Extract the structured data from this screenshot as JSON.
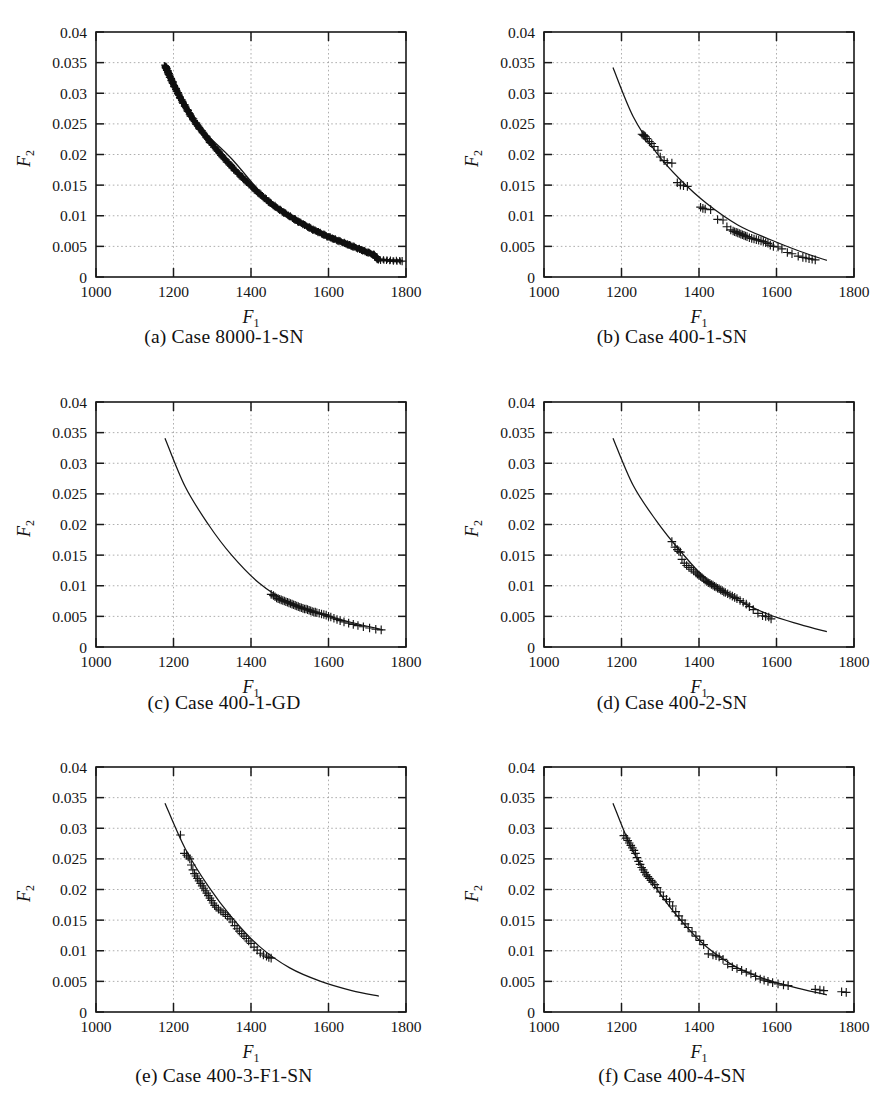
{
  "figure": {
    "panel_count": 6,
    "layout": "2 columns x 3 rows",
    "marker_symbol": "+",
    "curve_label": "fitted Pareto front curve"
  },
  "axes_common": {
    "xlabel": "F",
    "xlabel_sub": "1",
    "ylabel": "F",
    "ylabel_sub": "2",
    "xticks": [
      "1000",
      "1200",
      "1400",
      "1600",
      "1800"
    ],
    "xtick_values": [
      1000,
      1200,
      1400,
      1600,
      1800
    ],
    "yticks": [
      "0",
      "0.005",
      "0.01",
      "0.015",
      "0.02",
      "0.025",
      "0.03",
      "0.035",
      "0.04"
    ],
    "ytick_values": [
      0,
      0.005,
      0.01,
      0.015,
      0.02,
      0.025,
      0.03,
      0.035,
      0.04
    ],
    "xlim": [
      1000,
      1800
    ],
    "ylim": [
      0,
      0.04
    ],
    "grid": "dotted light gray on both axes",
    "frame": "full box"
  },
  "captions": [
    "(a) Case 8000-1-SN",
    "(b) Case 400-1-SN",
    "(c) Case 400-1-GD",
    "(d) Case 400-2-SN",
    "(e) Case 400-3-F1-SN",
    "(f) Case 400-4-SN"
  ],
  "chart_data": [
    {
      "type": "scatter",
      "title": "(a) Case 8000-1-SN",
      "xlabel": "F1",
      "ylabel": "F2",
      "xlim": [
        1000,
        1800
      ],
      "ylim": [
        0,
        0.04
      ],
      "grid": true,
      "legend": "none",
      "series": [
        {
          "name": "Pareto solutions",
          "marker": "+",
          "note": "very dense near-continuous band of ~8000 points tracing the front",
          "x": [
            1178,
            1182,
            1186,
            1190,
            1196,
            1202,
            1210,
            1218,
            1228,
            1238,
            1250,
            1262,
            1276,
            1290,
            1306,
            1322,
            1340,
            1358,
            1378,
            1398,
            1418,
            1438,
            1458,
            1478,
            1498,
            1518,
            1538,
            1558,
            1578,
            1598,
            1618,
            1638,
            1658,
            1678,
            1698,
            1718,
            1728,
            1790
          ],
          "y": [
            0.0345,
            0.034,
            0.0334,
            0.0328,
            0.032,
            0.0312,
            0.0302,
            0.0292,
            0.0281,
            0.027,
            0.0258,
            0.0247,
            0.0236,
            0.0224,
            0.0212,
            0.02,
            0.0187,
            0.0175,
            0.0162,
            0.015,
            0.0138,
            0.0127,
            0.0117,
            0.0108,
            0.01,
            0.0092,
            0.0085,
            0.0078,
            0.0072,
            0.0066,
            0.0061,
            0.0056,
            0.0051,
            0.0046,
            0.0041,
            0.0036,
            0.0028,
            0.0026
          ]
        },
        {
          "name": "fitted curve",
          "type": "line",
          "note": "hidden beneath the dense marker band",
          "x": [
            1178,
            1250,
            1350,
            1450,
            1550,
            1650,
            1728
          ],
          "y": [
            0.0345,
            0.0258,
            0.0193,
            0.0122,
            0.0082,
            0.0054,
            0.0028
          ]
        }
      ]
    },
    {
      "type": "scatter",
      "title": "(b) Case 400-1-SN",
      "xlabel": "F1",
      "ylabel": "F2",
      "xlim": [
        1000,
        1800
      ],
      "ylim": [
        0,
        0.04
      ],
      "grid": true,
      "legend": "none",
      "series": [
        {
          "name": "Pareto solutions",
          "marker": "+",
          "x": [
            1253,
            1256,
            1258,
            1260,
            1262,
            1266,
            1272,
            1278,
            1284,
            1294,
            1300,
            1310,
            1318,
            1330,
            1344,
            1352,
            1360,
            1370,
            1404,
            1410,
            1416,
            1430,
            1448,
            1462,
            1472,
            1482,
            1488,
            1492,
            1496,
            1500,
            1504,
            1508,
            1512,
            1516,
            1520,
            1524,
            1530,
            1536,
            1542,
            1548,
            1554,
            1560,
            1566,
            1572,
            1578,
            1584,
            1592,
            1604,
            1614,
            1628,
            1640,
            1656,
            1668,
            1676,
            1684,
            1692,
            1700
          ],
          "y": [
            0.0233,
            0.0232,
            0.0231,
            0.023,
            0.0229,
            0.0226,
            0.0221,
            0.0218,
            0.0213,
            0.0207,
            0.0196,
            0.019,
            0.0187,
            0.0186,
            0.0154,
            0.015,
            0.0149,
            0.0148,
            0.0114,
            0.0112,
            0.0111,
            0.011,
            0.0094,
            0.0093,
            0.0082,
            0.0077,
            0.0075,
            0.0074,
            0.0073,
            0.0072,
            0.0071,
            0.007,
            0.0069,
            0.0068,
            0.0067,
            0.0066,
            0.0064,
            0.0063,
            0.0062,
            0.0061,
            0.006,
            0.0059,
            0.0058,
            0.0056,
            0.0055,
            0.0052,
            0.005,
            0.0049,
            0.0046,
            0.004,
            0.0038,
            0.0034,
            0.0032,
            0.0031,
            0.003,
            0.0029,
            0.0028
          ]
        },
        {
          "name": "fitted curve",
          "type": "line",
          "x": [
            1178,
            1230,
            1290,
            1350,
            1420,
            1500,
            1580,
            1660,
            1730
          ],
          "y": [
            0.0342,
            0.0262,
            0.0203,
            0.016,
            0.012,
            0.0085,
            0.0062,
            0.0042,
            0.0027
          ]
        }
      ]
    },
    {
      "type": "scatter",
      "title": "(c) Case 400-1-GD",
      "xlabel": "F1",
      "ylabel": "F2",
      "xlim": [
        1000,
        1800
      ],
      "ylim": [
        0,
        0.04
      ],
      "grid": true,
      "legend": "none",
      "series": [
        {
          "name": "Pareto solutions",
          "marker": "+",
          "note": "tight cluster only in 1450-1740 range",
          "x": [
            1452,
            1458,
            1462,
            1466,
            1470,
            1474,
            1478,
            1482,
            1486,
            1490,
            1494,
            1498,
            1502,
            1506,
            1510,
            1514,
            1518,
            1522,
            1526,
            1530,
            1534,
            1538,
            1542,
            1546,
            1550,
            1554,
            1558,
            1562,
            1566,
            1570,
            1576,
            1582,
            1588,
            1594,
            1600,
            1606,
            1614,
            1622,
            1630,
            1640,
            1652,
            1664,
            1676,
            1690,
            1706,
            1722,
            1736
          ],
          "y": [
            0.0086,
            0.0084,
            0.0082,
            0.008,
            0.0079,
            0.0078,
            0.0077,
            0.0076,
            0.0075,
            0.0074,
            0.0073,
            0.0072,
            0.0071,
            0.007,
            0.0069,
            0.0068,
            0.0067,
            0.0066,
            0.0065,
            0.0064,
            0.0063,
            0.0062,
            0.0062,
            0.0061,
            0.006,
            0.0059,
            0.0058,
            0.0057,
            0.0057,
            0.0056,
            0.0055,
            0.0054,
            0.0053,
            0.0052,
            0.005,
            0.0049,
            0.0047,
            0.0045,
            0.0043,
            0.0041,
            0.0039,
            0.0037,
            0.0035,
            0.0033,
            0.0031,
            0.0029,
            0.0028
          ]
        },
        {
          "name": "fitted curve",
          "type": "line",
          "x": [
            1178,
            1230,
            1290,
            1350,
            1420,
            1500,
            1580,
            1660,
            1740
          ],
          "y": [
            0.0341,
            0.0262,
            0.02,
            0.015,
            0.0105,
            0.0072,
            0.0054,
            0.004,
            0.0028
          ]
        }
      ]
    },
    {
      "type": "scatter",
      "title": "(d) Case 400-2-SN",
      "xlabel": "F1",
      "ylabel": "F2",
      "xlim": [
        1000,
        1800
      ],
      "ylim": [
        0,
        0.04
      ],
      "grid": true,
      "legend": "none",
      "series": [
        {
          "name": "Pareto solutions",
          "marker": "+",
          "x": [
            1330,
            1338,
            1344,
            1348,
            1352,
            1356,
            1362,
            1368,
            1374,
            1380,
            1386,
            1392,
            1396,
            1400,
            1404,
            1408,
            1412,
            1416,
            1420,
            1424,
            1428,
            1432,
            1436,
            1440,
            1444,
            1448,
            1452,
            1456,
            1460,
            1464,
            1468,
            1474,
            1480,
            1486,
            1492,
            1498,
            1506,
            1514,
            1522,
            1530,
            1540,
            1552,
            1564,
            1572,
            1580,
            1586
          ],
          "y": [
            0.0172,
            0.0163,
            0.0159,
            0.0156,
            0.0155,
            0.0143,
            0.0137,
            0.0133,
            0.013,
            0.0127,
            0.0124,
            0.0121,
            0.0119,
            0.0117,
            0.0115,
            0.0113,
            0.0111,
            0.0109,
            0.0107,
            0.0105,
            0.0104,
            0.0102,
            0.0101,
            0.0099,
            0.0098,
            0.0096,
            0.0095,
            0.0093,
            0.0092,
            0.009,
            0.0089,
            0.0087,
            0.0085,
            0.0083,
            0.0081,
            0.0079,
            0.0076,
            0.0073,
            0.007,
            0.0066,
            0.0061,
            0.0055,
            0.0051,
            0.005,
            0.0049,
            0.0046
          ]
        },
        {
          "name": "fitted curve",
          "type": "line",
          "x": [
            1178,
            1230,
            1290,
            1350,
            1420,
            1500,
            1580,
            1660,
            1730
          ],
          "y": [
            0.0341,
            0.0264,
            0.0206,
            0.0158,
            0.011,
            0.0077,
            0.0053,
            0.0037,
            0.0025
          ]
        }
      ]
    },
    {
      "type": "scatter",
      "title": "(e) Case 400-3-F1-SN",
      "xlabel": "F1",
      "ylabel": "F2",
      "xlim": [
        1000,
        1800
      ],
      "ylim": [
        0,
        0.04
      ],
      "grid": true,
      "legend": "none",
      "series": [
        {
          "name": "Pareto solutions",
          "marker": "+",
          "x": [
            1218,
            1228,
            1234,
            1238,
            1242,
            1246,
            1250,
            1254,
            1258,
            1262,
            1266,
            1270,
            1274,
            1278,
            1282,
            1286,
            1290,
            1294,
            1298,
            1302,
            1306,
            1310,
            1316,
            1322,
            1328,
            1334,
            1340,
            1346,
            1352,
            1358,
            1364,
            1370,
            1376,
            1382,
            1388,
            1394,
            1400,
            1408,
            1416,
            1424,
            1432,
            1440,
            1446,
            1452
          ],
          "y": [
            0.0289,
            0.0259,
            0.0256,
            0.0253,
            0.025,
            0.024,
            0.0232,
            0.0226,
            0.0222,
            0.0218,
            0.0214,
            0.021,
            0.0206,
            0.0202,
            0.0198,
            0.0194,
            0.019,
            0.0186,
            0.0182,
            0.0178,
            0.0174,
            0.0171,
            0.0168,
            0.0165,
            0.0162,
            0.0159,
            0.0156,
            0.0152,
            0.0147,
            0.0141,
            0.0136,
            0.0132,
            0.0128,
            0.0124,
            0.012,
            0.0116,
            0.0112,
            0.0106,
            0.0101,
            0.0096,
            0.0093,
            0.0091,
            0.0089,
            0.0088
          ]
        },
        {
          "name": "fitted curve",
          "type": "line",
          "x": [
            1178,
            1230,
            1290,
            1350,
            1420,
            1500,
            1580,
            1660,
            1730
          ],
          "y": [
            0.0341,
            0.0267,
            0.0205,
            0.0155,
            0.0108,
            0.0072,
            0.005,
            0.0035,
            0.0026
          ]
        }
      ]
    },
    {
      "type": "scatter",
      "title": "(f) Case 400-4-SN",
      "xlabel": "F1",
      "ylabel": "F2",
      "xlim": [
        1000,
        1800
      ],
      "ylim": [
        0,
        0.04
      ],
      "grid": true,
      "legend": "none",
      "series": [
        {
          "name": "Pareto solutions",
          "marker": "+",
          "note": "includes outlier points beyond 1700 lying above the fitted curve",
          "x": [
            1206,
            1212,
            1216,
            1220,
            1224,
            1228,
            1232,
            1236,
            1240,
            1244,
            1248,
            1252,
            1256,
            1260,
            1264,
            1268,
            1272,
            1276,
            1280,
            1286,
            1292,
            1300,
            1308,
            1316,
            1324,
            1332,
            1340,
            1348,
            1356,
            1364,
            1372,
            1382,
            1392,
            1402,
            1412,
            1424,
            1436,
            1444,
            1452,
            1462,
            1474,
            1486,
            1498,
            1510,
            1522,
            1534,
            1546,
            1558,
            1568,
            1578,
            1590,
            1604,
            1618,
            1630,
            1700,
            1712,
            1722,
            1768,
            1780
          ],
          "y": [
            0.0288,
            0.0284,
            0.028,
            0.0276,
            0.0272,
            0.0268,
            0.0264,
            0.0259,
            0.0252,
            0.0246,
            0.0241,
            0.0236,
            0.0232,
            0.0228,
            0.0224,
            0.0221,
            0.0218,
            0.0215,
            0.0212,
            0.0208,
            0.0203,
            0.0196,
            0.0189,
            0.0184,
            0.018,
            0.0173,
            0.0164,
            0.0157,
            0.015,
            0.0144,
            0.0138,
            0.0131,
            0.0124,
            0.0117,
            0.011,
            0.0095,
            0.0093,
            0.0092,
            0.009,
            0.0086,
            0.0078,
            0.0074,
            0.0071,
            0.0068,
            0.0065,
            0.0062,
            0.0058,
            0.0054,
            0.0052,
            0.005,
            0.0048,
            0.0046,
            0.0044,
            0.0043,
            0.0037,
            0.0036,
            0.0035,
            0.0033,
            0.0032
          ]
        },
        {
          "name": "fitted curve",
          "type": "line",
          "x": [
            1178,
            1230,
            1290,
            1350,
            1420,
            1500,
            1580,
            1660,
            1730
          ],
          "y": [
            0.0341,
            0.0262,
            0.0202,
            0.0152,
            0.0106,
            0.0072,
            0.0052,
            0.0038,
            0.0028
          ]
        }
      ]
    }
  ]
}
